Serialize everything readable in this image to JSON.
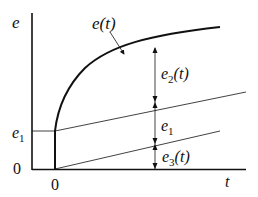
{
  "diagram": {
    "y_axis_label": "e",
    "x_axis_label": "t",
    "y_tick_e1": "e",
    "y_tick_e1_sub": "1",
    "y_origin": "0",
    "x_origin": "0",
    "curve_label": "e(t)",
    "dim_e2_main": "e",
    "dim_e2_sub": "2",
    "dim_e2_tail": "(t)",
    "dim_e1_main": "e",
    "dim_e1_sub": "1",
    "dim_e3_main": "e",
    "dim_e3_sub": "3",
    "dim_e3_tail": "(t)"
  }
}
